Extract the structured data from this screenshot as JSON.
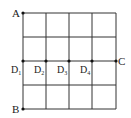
{
  "diagram": {
    "type": "grid",
    "rows": 4,
    "cols": 4,
    "grid": {
      "x0": 23,
      "y0": 13,
      "x1": 116,
      "y1": 109
    },
    "line_color": "#333333",
    "points": {
      "A": {
        "label": "A",
        "sub": ""
      },
      "B": {
        "label": "B",
        "sub": ""
      },
      "C": {
        "label": "C",
        "sub": ""
      },
      "D1": {
        "label": "D",
        "sub": "1"
      },
      "D2": {
        "label": "D",
        "sub": "2"
      },
      "D3": {
        "label": "D",
        "sub": "3"
      },
      "D4": {
        "label": "D",
        "sub": "4"
      }
    }
  }
}
